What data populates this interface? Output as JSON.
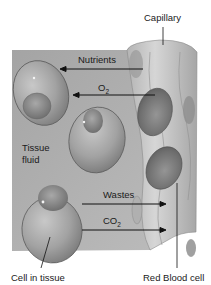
{
  "diagram": {
    "labels": {
      "capillary": "Capillary",
      "nutrients": "Nutrients",
      "o2_main": "O",
      "o2_sub": "2",
      "tissue_fluid_line1": "Tissue",
      "tissue_fluid_line2": "fluid",
      "wastes": "Wastes",
      "co2_main": "CO",
      "co2_sub": "2",
      "cell_in_tissue": "Cell in tissue",
      "red_blood_cell": "Red Blood cell"
    },
    "flows": [
      {
        "substance": "Nutrients",
        "direction": "capillary-to-cell"
      },
      {
        "substance": "O2",
        "direction": "capillary-to-cell"
      },
      {
        "substance": "Wastes",
        "direction": "cell-to-capillary"
      },
      {
        "substance": "CO2",
        "direction": "cell-to-capillary"
      }
    ],
    "colors": {
      "tissue_bg": "#a9a9a9",
      "cell_fill": "#9a9a9a",
      "cell_edge": "#5e5e5e",
      "nucleus": "#7c7c7c",
      "capillary": "#c4c4c4",
      "rbc": "#727272",
      "text": "#1a1a1a"
    }
  }
}
